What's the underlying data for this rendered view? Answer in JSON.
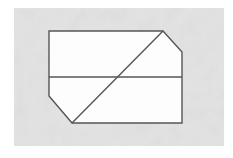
{
  "canvas": {
    "width": 233,
    "height": 158,
    "page_background": "#ffffff"
  },
  "paper": {
    "label": "textured paper sheet",
    "x": 14,
    "y": 8,
    "width": 210,
    "height": 138,
    "fill": "#e8e8e8",
    "fill_light": "#f1f1f1",
    "fill_dark": "#dedede",
    "noise_opacity": 0.55
  },
  "figure": {
    "name": "chamfered-rectangle-with-diagonal",
    "stroke_color": "#555555",
    "stroke_color_light": "#6e6e6e",
    "stroke_width": 1.4,
    "fill": "#fdfdfd",
    "vertices": [
      {
        "name": "top-left",
        "x": 49,
        "y": 31,
        "type": "square-corner"
      },
      {
        "name": "top-apex",
        "x": 163,
        "y": 31,
        "type": "chamfer-start"
      },
      {
        "name": "right-chamfer-end",
        "x": 182,
        "y": 52,
        "type": "chamfer-end"
      },
      {
        "name": "bottom-right",
        "x": 182,
        "y": 123,
        "type": "square-corner"
      },
      {
        "name": "bottom-apex",
        "x": 72,
        "y": 123,
        "type": "chamfer-start"
      },
      {
        "name": "left-chamfer-end",
        "x": 49,
        "y": 96,
        "type": "chamfer-end"
      }
    ],
    "outline_path": "M 49 31 L 163 31 L 182 52 L 182 123 L 72 123 L 49 96 Z",
    "interior_lines": [
      {
        "name": "horizontal-midline",
        "path": "M 49 77 L 182 77",
        "x1": 49,
        "y1": 77,
        "x2": 182,
        "y2": 77
      },
      {
        "name": "diagonal-line",
        "path": "M 72 123 L 163 31",
        "x1": 72,
        "y1": 123,
        "x2": 163,
        "y2": 31
      }
    ],
    "intersection": {
      "name": "diagonal-midline-crossing",
      "x": 117,
      "y": 77
    },
    "bounding_box": {
      "left": 49,
      "top": 31,
      "right": 182,
      "bottom": 123,
      "width": 133,
      "height": 92
    }
  }
}
